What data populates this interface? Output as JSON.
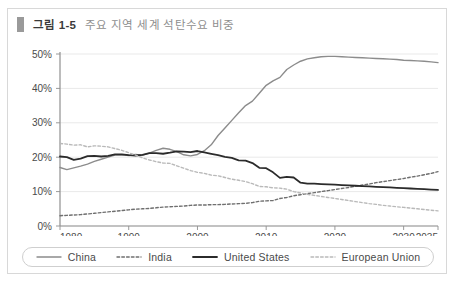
{
  "figure": {
    "label": "그림 1-5",
    "title": "주요 지역 세계 석탄수요 비중",
    "marker_color": "#9a9a9a",
    "border_color": "#d8d8d8"
  },
  "legend": {
    "items": [
      {
        "label": "China",
        "style": "solid",
        "color": "#8c8c8c",
        "width": 1.4
      },
      {
        "label": "India",
        "style": "dashed",
        "color": "#6f6f6f",
        "width": 1.4
      },
      {
        "label": "United States",
        "style": "solid",
        "color": "#2b2b2b",
        "width": 1.8
      },
      {
        "label": "European Union",
        "style": "dashed",
        "color": "#b9b9b9",
        "width": 1.4
      }
    ]
  },
  "chart_data": {
    "type": "line",
    "title": "주요 지역 세계 석탄수요 비중",
    "xlabel": "",
    "ylabel": "",
    "xlim": [
      1980,
      2035
    ],
    "ylim": [
      0,
      50
    ],
    "grid": true,
    "legend_position": "bottom",
    "x_ticks": [
      1980,
      1990,
      2000,
      2010,
      2020,
      2030,
      2035
    ],
    "x_tick_labels": [
      "1980",
      "1990",
      "2000",
      "2010",
      "2020",
      "2030",
      "2035"
    ],
    "y_ticks": [
      0,
      10,
      20,
      30,
      40,
      50
    ],
    "y_tick_labels": [
      "0%",
      "10%",
      "20%",
      "30%",
      "40%",
      "50%"
    ],
    "x": [
      1980,
      1981,
      1982,
      1983,
      1984,
      1985,
      1986,
      1987,
      1988,
      1989,
      1990,
      1991,
      1992,
      1993,
      1994,
      1995,
      1996,
      1997,
      1998,
      1999,
      2000,
      2001,
      2002,
      2003,
      2004,
      2005,
      2006,
      2007,
      2008,
      2009,
      2010,
      2011,
      2012,
      2013,
      2014,
      2015,
      2016,
      2017,
      2018,
      2019,
      2020,
      2021,
      2022,
      2023,
      2024,
      2025,
      2026,
      2027,
      2028,
      2029,
      2030,
      2031,
      2032,
      2033,
      2034,
      2035
    ],
    "series": [
      {
        "name": "China",
        "style": "solid",
        "color": "#8c8c8c",
        "values": [
          17.0,
          16.4,
          16.9,
          17.4,
          18.0,
          18.8,
          19.4,
          20.0,
          20.6,
          20.7,
          20.5,
          20.8,
          20.6,
          21.2,
          22.0,
          22.6,
          22.3,
          21.6,
          20.7,
          20.4,
          20.8,
          21.9,
          23.6,
          26.3,
          28.5,
          30.7,
          32.9,
          35.0,
          36.3,
          38.6,
          40.9,
          42.2,
          43.2,
          45.5,
          46.8,
          47.9,
          48.6,
          48.9,
          49.2,
          49.3,
          49.3,
          49.2,
          49.1,
          49.0,
          48.9,
          48.8,
          48.7,
          48.6,
          48.5,
          48.4,
          48.2,
          48.1,
          48.0,
          47.9,
          47.7,
          47.5
        ]
      },
      {
        "name": "India",
        "style": "dashed",
        "color": "#6f6f6f",
        "values": [
          3.0,
          3.1,
          3.2,
          3.3,
          3.5,
          3.7,
          3.9,
          4.1,
          4.3,
          4.5,
          4.7,
          4.9,
          5.0,
          5.1,
          5.3,
          5.5,
          5.6,
          5.7,
          5.8,
          6.0,
          6.1,
          6.1,
          6.2,
          6.2,
          6.3,
          6.4,
          6.5,
          6.6,
          6.8,
          7.2,
          7.3,
          7.4,
          8.0,
          8.3,
          8.8,
          9.1,
          9.4,
          9.7,
          10.0,
          10.3,
          10.6,
          10.9,
          11.2,
          11.6,
          11.9,
          12.2,
          12.6,
          12.9,
          13.2,
          13.5,
          13.8,
          14.2,
          14.5,
          14.9,
          15.3,
          15.8
        ]
      },
      {
        "name": "United States",
        "style": "solid",
        "color": "#2b2b2b",
        "values": [
          20.2,
          20.0,
          19.2,
          19.6,
          20.3,
          20.4,
          20.2,
          20.4,
          20.8,
          20.8,
          20.6,
          20.5,
          20.7,
          21.2,
          21.2,
          21.0,
          21.3,
          21.7,
          21.6,
          21.5,
          21.8,
          21.4,
          21.0,
          20.6,
          20.1,
          19.8,
          19.1,
          19.0,
          18.3,
          16.9,
          16.8,
          15.6,
          14.0,
          14.3,
          14.1,
          12.6,
          12.3,
          12.3,
          12.2,
          12.1,
          12.0,
          11.9,
          11.8,
          11.7,
          11.6,
          11.5,
          11.4,
          11.3,
          11.2,
          11.1,
          11.0,
          10.9,
          10.8,
          10.7,
          10.6,
          10.5
        ]
      },
      {
        "name": "European Union",
        "style": "dashed",
        "color": "#b9b9b9",
        "values": [
          24.0,
          23.8,
          23.5,
          23.6,
          23.0,
          23.3,
          23.2,
          23.0,
          22.5,
          22.0,
          21.3,
          20.6,
          19.8,
          19.2,
          18.7,
          18.3,
          18.2,
          17.5,
          16.8,
          16.1,
          15.6,
          15.3,
          14.8,
          14.6,
          14.1,
          13.6,
          13.3,
          12.9,
          12.3,
          11.5,
          11.4,
          11.1,
          11.0,
          10.7,
          10.0,
          9.6,
          9.2,
          8.9,
          8.6,
          8.3,
          8.0,
          7.7,
          7.4,
          7.1,
          6.8,
          6.5,
          6.3,
          6.0,
          5.8,
          5.6,
          5.4,
          5.2,
          5.0,
          4.8,
          4.6,
          4.4
        ]
      }
    ]
  }
}
